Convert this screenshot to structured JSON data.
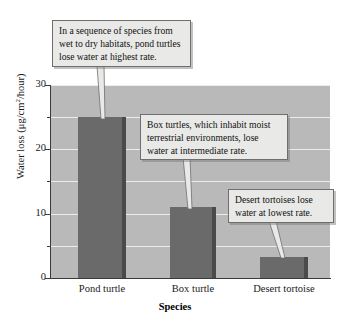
{
  "chart_data": {
    "type": "bar",
    "title": "",
    "categories": [
      "Pond turtle",
      "Box turtle",
      "Desert tortoise"
    ],
    "values": [
      25,
      11,
      3.3
    ],
    "xlabel": "Species",
    "ylabel": "Water loss (μg/cm²/hour)",
    "ylim": [
      0,
      30
    ],
    "yticks_major": [
      "0",
      "10",
      "20",
      "30"
    ],
    "yticks_minor": [
      5,
      15,
      25
    ],
    "grid": true,
    "legend": "none",
    "series": [
      {
        "name": "Water loss",
        "values": [
          25,
          11,
          3.3
        ]
      }
    ],
    "annotations": [
      "In a sequence of species from wet to dry habitats, pond turtles lose water at highest rate.",
      "Box turtles, which inhabit moist terrestrial environments, lose water at intermediate rate.",
      "Desert tortoises lose water at lowest rate."
    ],
    "colors": {
      "bar": "#6a6a6a",
      "bar_shade": "#4a4a4a",
      "plot_background": "#b9b9b9",
      "gridline": "#ececeb",
      "callout_background": "#e9e9e7",
      "callout_border": "#6f6f6f",
      "axis": "#3a3a3a"
    }
  },
  "axes": {
    "y": {
      "label_text": "Water loss (μg/cm",
      "label_sup": "2",
      "label_tail": "/hour)",
      "ticks": [
        {
          "value": "0"
        },
        {
          "value": "10"
        },
        {
          "value": "20"
        },
        {
          "value": "30"
        }
      ]
    },
    "x": {
      "title": "Species",
      "ticks": [
        {
          "label": "Pond turtle"
        },
        {
          "label": "Box turtle"
        },
        {
          "label": "Desert tortoise"
        }
      ]
    }
  },
  "callouts": [
    {
      "id": "callout-pond-turtle",
      "line1": "In a sequence of species from",
      "line2": "wet to dry habitats, pond turtles",
      "line3": "lose water at highest rate."
    },
    {
      "id": "callout-box-turtle",
      "line1": "Box turtles, which inhabit moist",
      "line2": "terrestrial environments, lose",
      "line3": "water at intermediate rate."
    },
    {
      "id": "callout-desert-tortoise",
      "line1": "Desert tortoises lose",
      "line2": "water at lowest rate.",
      "line3": ""
    }
  ]
}
